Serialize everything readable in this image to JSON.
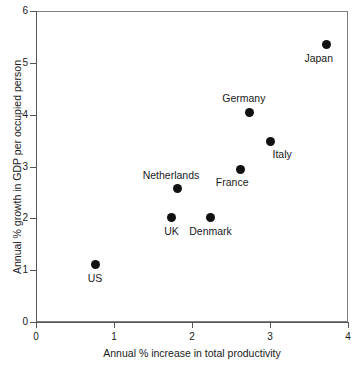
{
  "chart_data": {
    "type": "scatter",
    "title": "",
    "xlabel": "Annual % increase in total productivity",
    "ylabel": "Annual % growth in GDP per occupied person",
    "xlim": [
      0,
      4
    ],
    "ylim": [
      0,
      6
    ],
    "xticks": [
      "0",
      "1",
      "2",
      "3",
      "4"
    ],
    "yticks": [
      "0",
      "1",
      "2",
      "3",
      "4",
      "5",
      "6"
    ],
    "grid": false,
    "legend": "none",
    "marker_color": "#111111",
    "axis_color": "#555555",
    "text_color": "#1a1a1a",
    "points": [
      {
        "label": "US",
        "x": 0.76,
        "y": 1.1,
        "label_pos": "below"
      },
      {
        "label": "UK",
        "x": 1.74,
        "y": 2.01,
        "label_pos": "below"
      },
      {
        "label": "Netherlands",
        "x": 1.81,
        "y": 2.57,
        "label_pos": "above-left"
      },
      {
        "label": "Denmark",
        "x": 2.24,
        "y": 2.01,
        "label_pos": "below"
      },
      {
        "label": "France",
        "x": 2.62,
        "y": 2.95,
        "label_pos": "below-left"
      },
      {
        "label": "Germany",
        "x": 2.74,
        "y": 4.05,
        "label_pos": "above-left"
      },
      {
        "label": "Italy",
        "x": 3.0,
        "y": 3.49,
        "label_pos": "below-right"
      },
      {
        "label": "Japan",
        "x": 3.73,
        "y": 5.35,
        "label_pos": "below-left"
      }
    ]
  }
}
